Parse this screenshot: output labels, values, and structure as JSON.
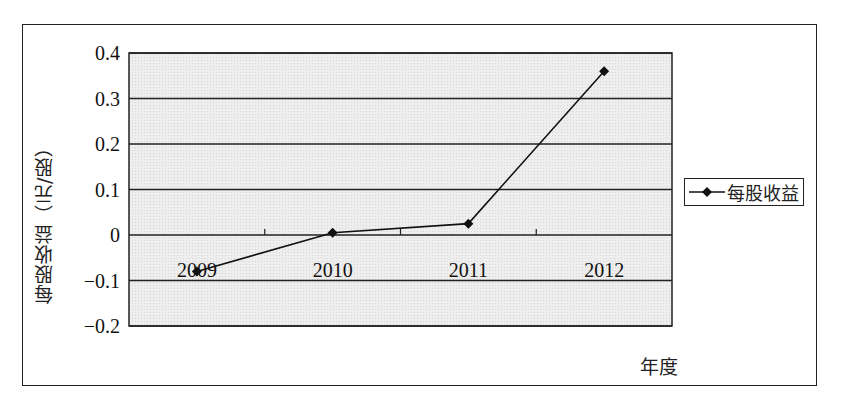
{
  "chart_data": {
    "type": "line",
    "title": "",
    "xlabel": "年度",
    "ylabel": "每股收益（元/股）",
    "categories": [
      "2009",
      "2010",
      "2011",
      "2012"
    ],
    "series": [
      {
        "name": "每股收益",
        "values": [
          -0.08,
          0.005,
          0.025,
          0.36
        ],
        "marker": "diamond",
        "color": "#111111"
      }
    ],
    "yticks": [
      "0.4",
      "0.3",
      "0.2",
      "0.1",
      "0",
      "-0.1",
      "-0.2"
    ],
    "ylim": [
      -0.2,
      0.4
    ],
    "grid": true,
    "legend_position": "right",
    "plot_background": "#ececec"
  },
  "labels": {
    "ylabel": "每股收益（元/股）",
    "xlabel": "年度",
    "legend": "每股收益"
  }
}
